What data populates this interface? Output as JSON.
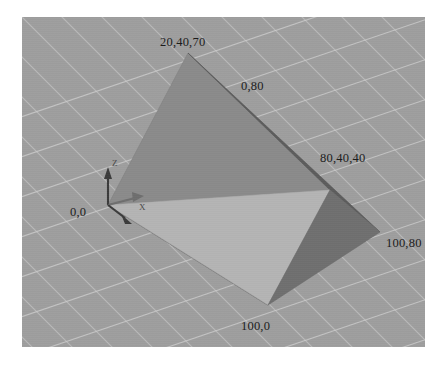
{
  "scene": {
    "title": "3D tetrahedron viewport",
    "background_color": "#9e9e9e",
    "grid_line_color": "#c9c9c9",
    "page_background": "#ffffff",
    "viewport": {
      "x": 22,
      "y": 17,
      "width": 403,
      "height": 330
    }
  },
  "axis_gizmo": {
    "origin_label": "0,0",
    "axes": [
      {
        "name": "z-axis",
        "letter": "Z",
        "direction": "up",
        "color": "#3a3a3a"
      },
      {
        "name": "x-axis",
        "letter": "X",
        "direction": "right",
        "color": "#6b6b6b"
      },
      {
        "name": "y-axis",
        "letter": "",
        "direction": "down-right",
        "color": "#3a3a3a"
      }
    ]
  },
  "vertices": [
    {
      "name": "apex",
      "label": "20,40,70",
      "x": 188,
      "y": 53,
      "label_x": 160,
      "label_y": 36
    },
    {
      "name": "back-top",
      "label": "0,80",
      "x": 330,
      "y": 190,
      "label_x": 241,
      "label_y": 80
    },
    {
      "name": "mid-right",
      "label": "80,40,40",
      "x": 330,
      "y": 190,
      "label_x": 320,
      "label_y": 152
    },
    {
      "name": "far-right",
      "label": "100,80",
      "x": 380,
      "y": 232,
      "label_x": 386,
      "label_y": 237
    },
    {
      "name": "bottom",
      "label": "100,0",
      "x": 268,
      "y": 305,
      "label_x": 241,
      "label_y": 320
    },
    {
      "name": "origin",
      "label": "0,0",
      "x": 108,
      "y": 205,
      "label_x": 70,
      "label_y": 206
    }
  ],
  "faces": [
    {
      "name": "face-front-left",
      "shade": "#8a8a8a"
    },
    {
      "name": "face-top-sliver",
      "shade": "#5c5c5c"
    },
    {
      "name": "face-bottom-light",
      "shade": "#b4b4b4"
    },
    {
      "name": "face-right-dark",
      "shade": "#6f6f6f"
    }
  ],
  "colors": {
    "label_text": "#1b1b1b",
    "axis_letter": "#4a4a4a",
    "edge_dark": "#4a4a4a"
  }
}
